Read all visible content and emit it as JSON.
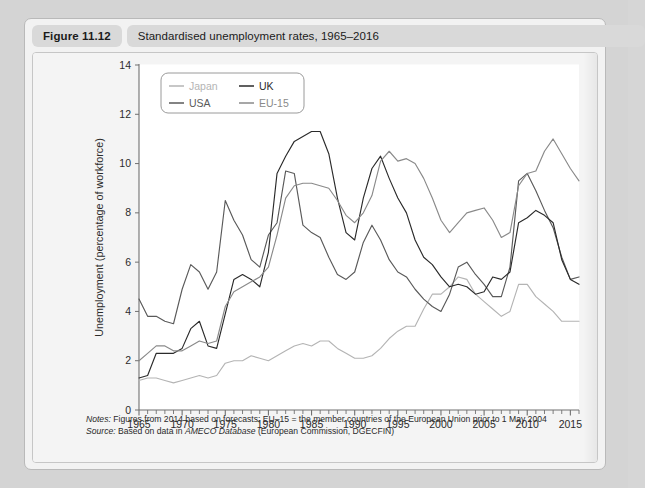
{
  "figure": {
    "number": "Figure 11.12",
    "title": "Standardised unemployment rates, 1965–2016"
  },
  "notes": {
    "notes_label": "Notes:",
    "notes_text": " Figures from 2014 based on forecasts; EU–15 = the member countries of the European Union prior to 1 May 2004",
    "source_label": "Source:",
    "source_text_pre": " Based on data in ",
    "source_italic": "AMECO Database",
    "source_text_post": " (European Commission, DGECFIN)"
  },
  "chart_data": {
    "type": "line",
    "title": "Standardised unemployment rates, 1965–2016",
    "xlabel": "",
    "ylabel": "Unemployment (percentage of workforce)",
    "xlim": [
      1965,
      2016
    ],
    "ylim": [
      0,
      14
    ],
    "ytick_step": 2,
    "yticks": [
      0,
      2,
      4,
      6,
      8,
      10,
      12,
      14
    ],
    "xticks": [
      1965,
      1970,
      1975,
      1980,
      1985,
      1990,
      1995,
      2000,
      2005,
      2010,
      2015
    ],
    "x_minor_tick_step": 1,
    "grid": false,
    "legend_position": "top-left",
    "x": [
      1965,
      1966,
      1967,
      1968,
      1969,
      1970,
      1971,
      1972,
      1973,
      1974,
      1975,
      1976,
      1977,
      1978,
      1979,
      1980,
      1981,
      1982,
      1983,
      1984,
      1985,
      1986,
      1987,
      1988,
      1989,
      1990,
      1991,
      1992,
      1993,
      1994,
      1995,
      1996,
      1997,
      1998,
      1999,
      2000,
      2001,
      2002,
      2003,
      2004,
      2005,
      2006,
      2007,
      2008,
      2009,
      2010,
      2011,
      2012,
      2013,
      2014,
      2015,
      2016
    ],
    "series": [
      {
        "name": "Japan",
        "color": "#b4b4b4",
        "values": [
          1.2,
          1.3,
          1.3,
          1.2,
          1.1,
          1.2,
          1.3,
          1.4,
          1.3,
          1.4,
          1.9,
          2.0,
          2.0,
          2.2,
          2.1,
          2.0,
          2.2,
          2.4,
          2.6,
          2.7,
          2.6,
          2.8,
          2.8,
          2.5,
          2.3,
          2.1,
          2.1,
          2.2,
          2.5,
          2.9,
          3.2,
          3.4,
          3.4,
          4.1,
          4.7,
          4.7,
          5.0,
          5.4,
          5.3,
          4.7,
          4.4,
          4.1,
          3.8,
          4.0,
          5.1,
          5.1,
          4.6,
          4.3,
          4.0,
          3.6,
          3.6,
          3.6
        ]
      },
      {
        "name": "USA",
        "color": "#5a5a5a",
        "values": [
          4.5,
          3.8,
          3.8,
          3.6,
          3.5,
          4.9,
          5.9,
          5.6,
          4.9,
          5.6,
          8.5,
          7.7,
          7.1,
          6.1,
          5.8,
          7.1,
          7.6,
          9.7,
          9.6,
          7.5,
          7.2,
          7.0,
          6.2,
          5.5,
          5.3,
          5.6,
          6.8,
          7.5,
          6.9,
          6.1,
          5.6,
          5.4,
          4.9,
          4.5,
          4.2,
          4.0,
          4.7,
          5.8,
          6.0,
          5.5,
          5.1,
          4.6,
          4.6,
          5.8,
          9.3,
          9.6,
          8.9,
          8.1,
          7.4,
          6.2,
          5.3,
          5.4
        ]
      },
      {
        "name": "UK",
        "color": "#2b2b2b",
        "values": [
          1.3,
          1.4,
          2.3,
          2.3,
          2.3,
          2.5,
          3.3,
          3.6,
          2.6,
          2.5,
          3.9,
          5.3,
          5.5,
          5.3,
          5.0,
          6.4,
          9.6,
          10.3,
          10.9,
          11.1,
          11.3,
          11.3,
          10.4,
          8.6,
          7.2,
          6.9,
          8.6,
          9.8,
          10.3,
          9.4,
          8.6,
          8.0,
          6.9,
          6.2,
          5.9,
          5.4,
          5.0,
          5.1,
          5.0,
          4.7,
          4.8,
          5.4,
          5.3,
          5.6,
          7.6,
          7.8,
          8.1,
          7.9,
          7.6,
          6.1,
          5.3,
          5.1
        ]
      },
      {
        "name": "EU-15",
        "color": "#8a8a8a",
        "values": [
          2.0,
          2.3,
          2.6,
          2.6,
          2.4,
          2.4,
          2.6,
          2.8,
          2.7,
          2.8,
          4.2,
          4.8,
          5.0,
          5.2,
          5.4,
          5.8,
          7.1,
          8.6,
          9.1,
          9.2,
          9.2,
          9.1,
          9.0,
          8.5,
          7.9,
          7.6,
          8.0,
          8.7,
          10.1,
          10.5,
          10.1,
          10.2,
          10.0,
          9.4,
          8.6,
          7.7,
          7.2,
          7.6,
          8.0,
          8.1,
          8.2,
          7.7,
          7.0,
          7.2,
          9.1,
          9.6,
          9.7,
          10.5,
          11.0,
          10.4,
          9.8,
          9.3
        ]
      }
    ]
  },
  "legend": [
    {
      "label": "Japan",
      "color": "#b4b4b4"
    },
    {
      "label": "UK",
      "color": "#2b2b2b"
    },
    {
      "label": "USA",
      "color": "#5a5a5a"
    },
    {
      "label": "EU-15",
      "color": "#8a8a8a"
    }
  ]
}
